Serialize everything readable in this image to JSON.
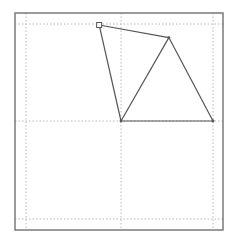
{
  "figure": {
    "frame": {
      "x1": 15,
      "y1": 13,
      "x2": 223,
      "y2": 230,
      "color": "#7a7a7a"
    },
    "grid": {
      "color": "#b8b8b8",
      "vertical_px": [
        26,
        121,
        213
      ],
      "horizontal_px": [
        24,
        121,
        219
      ]
    },
    "line_color": "#555555",
    "marker_color": "#555555"
  },
  "chart_data": {
    "type": "line",
    "title": "",
    "xlabel": "",
    "ylabel": "",
    "grid": true,
    "xlim": [
      -1.1,
      1.1
    ],
    "ylim": [
      -1.1,
      1.1
    ],
    "grid_values": {
      "x": [
        -1,
        0,
        1
      ],
      "y": [
        -1,
        0,
        1
      ]
    },
    "vertices": [
      {
        "name": "A",
        "x": -0.23,
        "y": 0.99,
        "marker": "square"
      },
      {
        "name": "B",
        "x": 0.52,
        "y": 0.86,
        "marker": "dot"
      },
      {
        "name": "C",
        "x": 1.0,
        "y": 0.0,
        "marker": "dot"
      },
      {
        "name": "D",
        "x": 0.0,
        "y": 0.0,
        "marker": "dot"
      }
    ],
    "segments": [
      [
        "A",
        "B"
      ],
      [
        "B",
        "C"
      ],
      [
        "C",
        "D"
      ],
      [
        "D",
        "A"
      ],
      [
        "D",
        "B"
      ]
    ]
  }
}
